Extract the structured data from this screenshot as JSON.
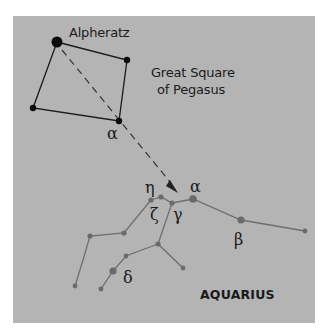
{
  "diagram": {
    "title": "",
    "background_color": "#b4b4b4",
    "labels": {
      "alpheratz": "Alpheratz",
      "great_square_line1": "Great Square",
      "great_square_line2": "of Pegasus",
      "pegasus_alpha": "α",
      "aqr_eta": "η",
      "aqr_zeta": "ζ",
      "aqr_gamma": "γ",
      "aqr_alpha": "α",
      "aqr_beta": "β",
      "aqr_delta": "δ",
      "constellation": "AQUARIUS"
    },
    "colors": {
      "pegasus_lines": "#1a1a1a",
      "pegasus_stars": "#0a0a0a",
      "aquarius_lines": "#6e6e6e",
      "aquarius_stars": "#6a6a6a",
      "pointer_arrow": "#333333"
    }
  }
}
